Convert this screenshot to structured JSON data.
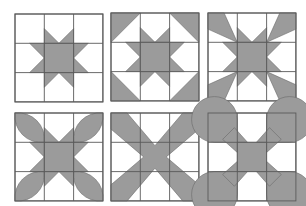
{
  "figure": {
    "fill_color": "#9b9b9b",
    "line_color": "#5a5a5a",
    "background": "#ffffff",
    "grid_size": 3,
    "blocks": [
      {
        "id": "block-1",
        "pattern": "sawtooth-star",
        "label": "Eight-point sawtooth star"
      },
      {
        "id": "block-2",
        "pattern": "star-with-corner-triangles",
        "label": "Star with half-square corner triangles"
      },
      {
        "id": "block-3",
        "pattern": "star-with-corner-rays",
        "label": "Star with corner kite rays"
      },
      {
        "id": "block-4",
        "pattern": "star-with-corner-petals",
        "label": "Center square with corner petals"
      },
      {
        "id": "block-5",
        "pattern": "diagonal-cross",
        "label": "Diagonal X cross"
      },
      {
        "id": "block-6",
        "pattern": "cross-with-rounded-corners",
        "label": "X cross with rounded corner lobes"
      }
    ]
  }
}
